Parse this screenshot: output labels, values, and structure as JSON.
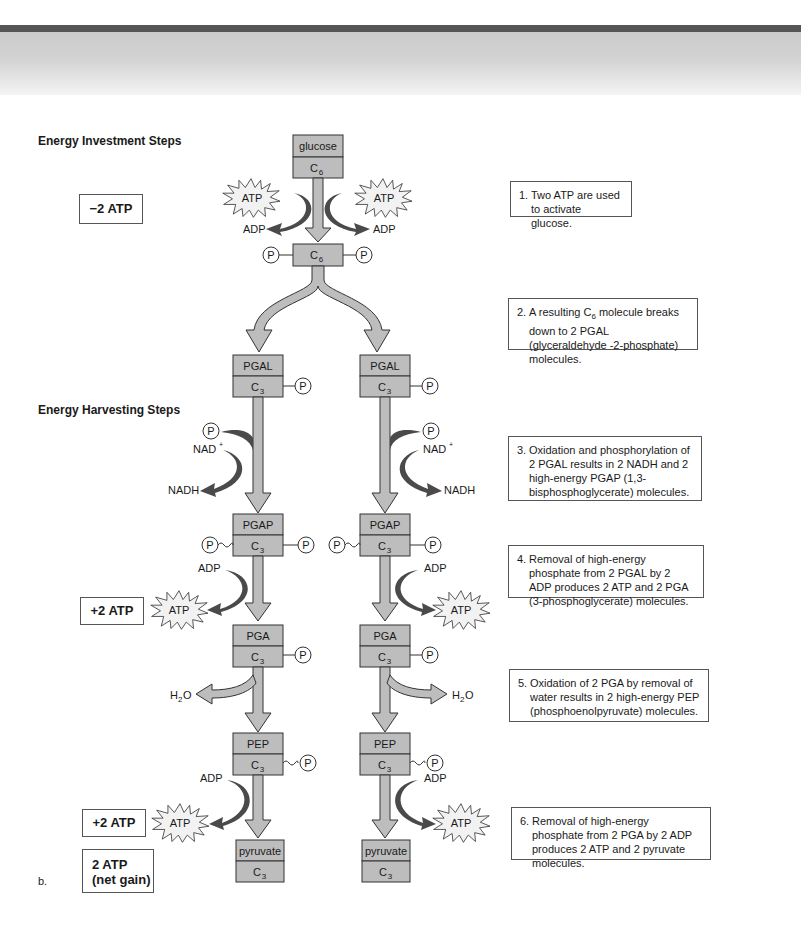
{
  "section_labels": {
    "investment": "Energy Investment Steps",
    "harvesting": "Energy Harvesting Steps"
  },
  "summary": {
    "investment": "−2 ATP",
    "harvest1": "+2 ATP",
    "harvest2": "+2 ATP",
    "net_line1": "2 ATP",
    "net_line2": "(net gain)"
  },
  "figure_label": "b.",
  "molecules": {
    "glucose": {
      "name": "glucose",
      "carbons": "C",
      "sub": "6"
    },
    "fructose_bp": {
      "carbons": "C",
      "sub": "6"
    },
    "pgal": {
      "name": "PGAL",
      "carbons": "C",
      "sub": "3"
    },
    "pgap": {
      "name": "PGAP",
      "carbons": "C",
      "sub": "3"
    },
    "pga": {
      "name": "PGA",
      "carbons": "C",
      "sub": "3"
    },
    "pep": {
      "name": "PEP",
      "carbons": "C",
      "sub": "3"
    },
    "pyruvate": {
      "name": "pyruvate",
      "carbons": "C",
      "sub": "3"
    }
  },
  "labels": {
    "atp": "ATP",
    "adp": "ADP",
    "phosphate": "P",
    "nad": "NAD",
    "nad_sup": "+",
    "nadh": "NADH",
    "water_h": "H",
    "water_sub": "2",
    "water_o": "O"
  },
  "steps": [
    {
      "num": "1.",
      "text": "Two ATP are used to activate glucose."
    },
    {
      "num": "2.",
      "text_pre": "A resulting C",
      "text_sub": "6",
      "text_post": " molecule breaks down to 2 PGAL (glyceraldehyde -2-phosphate) molecules."
    },
    {
      "num": "3.",
      "text": "Oxidation and phosphorylation of 2 PGAL results in 2 NADH and 2 high-energy PGAP (1,3-bisphosphoglycerate) molecules."
    },
    {
      "num": "4.",
      "text": "Removal of high-energy phosphate from 2 PGAL by 2 ADP produces 2 ATP and 2 PGA (3-phosphoglycerate) molecules."
    },
    {
      "num": "5.",
      "text": "Oxidation of 2 PGA by removal of water results in 2 high-energy PEP (phosphoenolpyruvate) molecules."
    },
    {
      "num": "6.",
      "text": "Removal of high-energy phosphate from 2 PGA by 2 ADP produces 2 ATP and 2 pyruvate molecules."
    }
  ],
  "colors": {
    "box_fill": "#bdbdbd",
    "arrow_light": "#bdbdbd",
    "arrow_dark": "#4a4a4a",
    "starburst": "#f2f2f2"
  }
}
